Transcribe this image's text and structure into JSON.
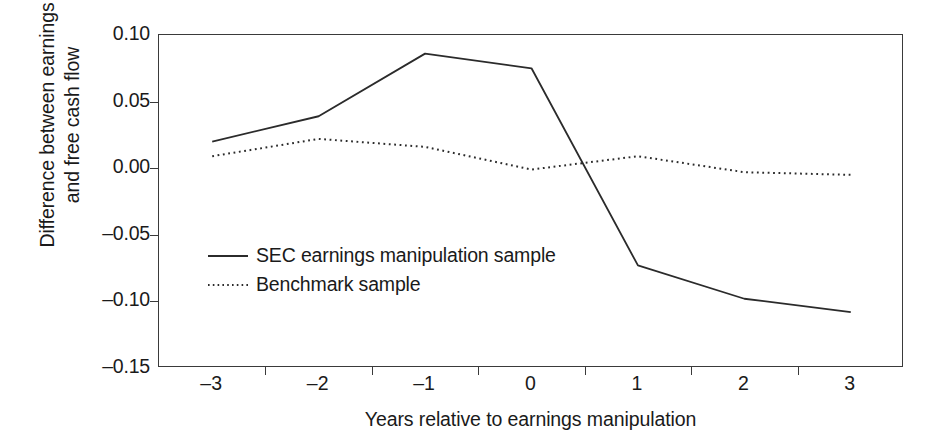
{
  "chart_data": {
    "type": "line",
    "title": "",
    "xlabel": "Years relative to earnings manipulation",
    "ylabel_line1": "Difference between earnings",
    "ylabel_line2": "and free cash flow",
    "categories": [
      "–3",
      "–2",
      "–1",
      "0",
      "1",
      "2",
      "3"
    ],
    "x": [
      -3,
      -2,
      -1,
      0,
      1,
      2,
      3
    ],
    "series": [
      {
        "name": "SEC earnings manipulation sample",
        "style": "solid",
        "color": "#2b2b2b",
        "values": [
          0.02,
          0.039,
          0.086,
          0.075,
          -0.073,
          -0.098,
          -0.108
        ]
      },
      {
        "name": "Benchmark sample",
        "style": "dotted",
        "color": "#2b2b2b",
        "values": [
          0.009,
          0.022,
          0.016,
          -0.001,
          0.009,
          -0.003,
          -0.005
        ]
      }
    ],
    "ylim": [
      -0.15,
      0.1
    ],
    "yticks": [
      0.1,
      0.05,
      0.0,
      -0.05,
      -0.1,
      -0.15
    ],
    "ytick_labels": [
      "0.10",
      "0.05",
      "0.00",
      "–0.05",
      "–0.10",
      "–0.15"
    ],
    "grid": false,
    "legend_position": "inside-center-left",
    "axis_color": "#3a3a3a",
    "background": "#ffffff"
  },
  "legend": {
    "items": [
      {
        "label": "SEC earnings manipulation sample",
        "style": "solid"
      },
      {
        "label": "Benchmark sample",
        "style": "dotted"
      }
    ]
  }
}
